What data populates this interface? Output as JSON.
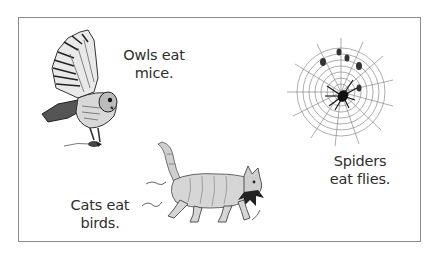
{
  "figure": {
    "border_color": "#8a8a8a",
    "text_color": "#2e2e2e",
    "panels": [
      {
        "id": "owl",
        "illustration": "owl-icon",
        "caption_lines": [
          "Owls eat",
          "mice."
        ]
      },
      {
        "id": "cat",
        "illustration": "cat-icon",
        "caption_lines": [
          "Cats eat",
          "birds."
        ]
      },
      {
        "id": "spider",
        "illustration": "spider-web-icon",
        "caption_lines": [
          "Spiders",
          "eat flies."
        ]
      }
    ]
  }
}
